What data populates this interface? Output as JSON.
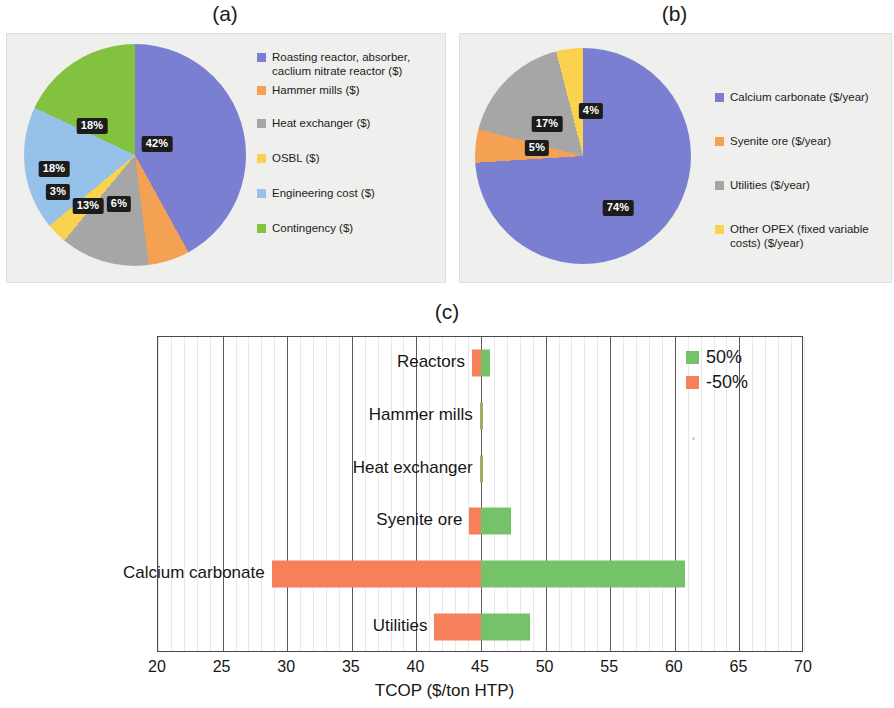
{
  "figure": {
    "panel_a_caption": "(a)",
    "panel_b_caption": "(b)",
    "panel_c_caption": "(c)"
  },
  "colors": {
    "purple": "#7b7fd1",
    "orange": "#f5a153",
    "gray": "#a6a6a6",
    "yellow": "#fad24e",
    "blue": "#96c1e8",
    "green": "#83c23f",
    "bar_pos": "#74c368",
    "bar_neg": "#f5805a",
    "label_bg": "#1c1c1c"
  },
  "chart_data": [
    {
      "type": "pie",
      "title": "(a)",
      "labels": [
        "Roasting reactor, absorber, caclium nitrate reactor  ($)",
        "Hammer mills ($)",
        "Heat exchanger ($)",
        "OSBL ($)",
        "Engineering cost ($)",
        "Contingency ($)"
      ],
      "values": [
        42,
        6,
        13,
        3,
        18,
        18
      ],
      "value_labels": [
        "42%",
        "6%",
        "13%",
        "3%",
        "18%",
        "18%"
      ],
      "colors": [
        "#7b7fd1",
        "#f5a153",
        "#a6a6a6",
        "#fad24e",
        "#96c1e8",
        "#83c23f"
      ],
      "legend_position": "right",
      "start_angle": 0,
      "direction": "clockwise"
    },
    {
      "type": "pie",
      "title": "(b)",
      "labels": [
        "Calcium carbonate ($/year)",
        "Syenite ore ($/year)",
        "Utilities ($/year)",
        "Other OPEX (fixed variable costs) ($/year)"
      ],
      "values": [
        74,
        5,
        17,
        4
      ],
      "value_labels": [
        "74%",
        "5%",
        "17%",
        "4%"
      ],
      "colors": [
        "#7b7fd1",
        "#f5a153",
        "#a6a6a6",
        "#fad24e"
      ],
      "legend_position": "right",
      "start_angle": 0,
      "direction": "clockwise"
    },
    {
      "type": "bar",
      "subtype": "tornado",
      "title": "(c)",
      "xlabel": "TCOP ($/ton HTP)",
      "ylabel": "",
      "xlim": [
        20,
        70
      ],
      "xticks": [
        20,
        25,
        30,
        35,
        40,
        45,
        50,
        55,
        60,
        65,
        70
      ],
      "xtick_labels": [
        "20",
        "25",
        "30",
        "35",
        "40",
        "45",
        "50",
        "55",
        "60",
        "65",
        "70"
      ],
      "baseline": 45,
      "grid": true,
      "legend_position": "top-right",
      "legend": [
        {
          "name": "50%",
          "color": "#74c368"
        },
        {
          "name": "-50%",
          "color": "#f5805a"
        }
      ],
      "categories": [
        "Reactors",
        "Hammer mills",
        "Heat exchanger",
        "Syenite ore",
        "Calcium carbonate",
        "Utilities"
      ],
      "series": [
        {
          "name": "-50%",
          "color": "#f5805a",
          "values": [
            44.3,
            44.9,
            44.9,
            44.1,
            28.8,
            41.4
          ]
        },
        {
          "name": "50%",
          "color": "#74c368",
          "values": [
            45.7,
            45.1,
            45.1,
            47.3,
            60.8,
            48.8
          ]
        }
      ]
    }
  ],
  "panel_a": {
    "caption": "(a)",
    "legend": [
      {
        "label": "Roasting reactor, absorber, caclium nitrate reactor  ($)",
        "color": "#7b7fd1"
      },
      {
        "label": "Hammer mills ($)",
        "color": "#f5a153"
      },
      {
        "label": "Heat exchanger ($)",
        "color": "#a6a6a6"
      },
      {
        "label": "OSBL ($)",
        "color": "#fad24e"
      },
      {
        "label": "Engineering cost ($)",
        "color": "#96c1e8"
      },
      {
        "label": "Contingency ($)",
        "color": "#83c23f"
      }
    ],
    "slice_labels": {
      "purple": "42%",
      "orange": "6%",
      "gray": "13%",
      "yellow": "3%",
      "blue": "18%",
      "green": "18%"
    }
  },
  "panel_b": {
    "caption": "(b)",
    "legend": [
      {
        "label": "Calcium carbonate ($/year)",
        "color": "#7b7fd1"
      },
      {
        "label": "Syenite ore ($/year)",
        "color": "#f5a153"
      },
      {
        "label": "Utilities ($/year)",
        "color": "#a6a6a6"
      },
      {
        "label": "Other OPEX (fixed variable costs) ($/year)",
        "color": "#fad24e"
      }
    ],
    "slice_labels": {
      "purple": "74%",
      "orange": "5%",
      "gray": "17%",
      "yellow": "4%"
    }
  },
  "panel_c": {
    "caption": "(c)",
    "axis_title": "TCOP ($/ton HTP)",
    "ticks": [
      "20",
      "25",
      "30",
      "35",
      "40",
      "45",
      "50",
      "55",
      "60",
      "65",
      "70"
    ],
    "row_labels": [
      "Reactors",
      "Hammer mills",
      "Heat exchanger",
      "Syenite ore",
      "Calcium carbonate",
      "Utilities"
    ],
    "legend": [
      {
        "label": "50%",
        "color": "#74c368"
      },
      {
        "label": "-50%",
        "color": "#f5805a"
      }
    ]
  }
}
